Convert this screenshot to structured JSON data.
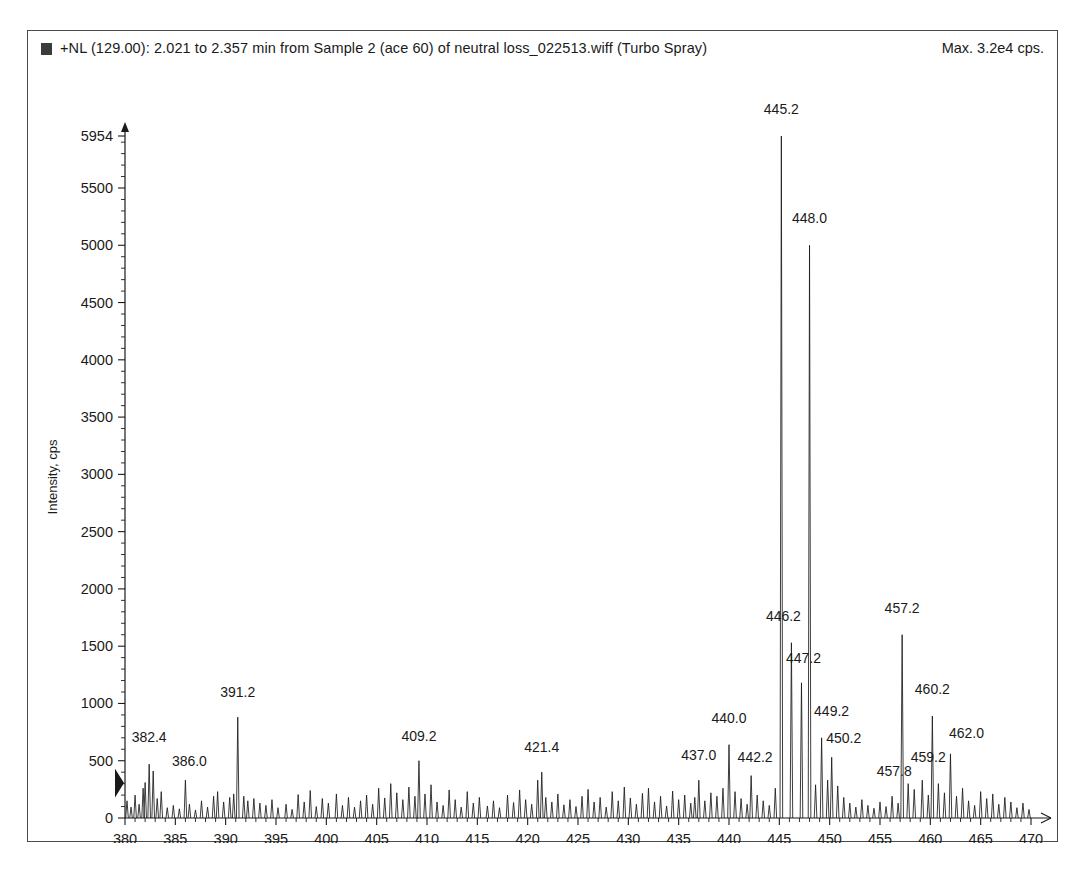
{
  "header": {
    "marker_icon": "filled-square-icon",
    "title": "+NL (129.00): 2.021 to 2.357 min from Sample 2 (ace 60) of neutral loss_022513.wiff (Turbo Spray)",
    "max_label": "Max. 3.2e4 cps."
  },
  "chart_data": {
    "type": "line",
    "title": "+NL (129.00): 2.021 to 2.357 min from Sample 2 (ace 60) of neutral loss_022513.wiff (Turbo Spray)",
    "subtitle": "Max. 3.2e4 cps.",
    "xlabel": "m/z, Da",
    "ylabel": "Intensity, cps",
    "xlim": [
      380,
      470
    ],
    "ylim": [
      0,
      5954
    ],
    "grid": false,
    "legend": "none",
    "xticks": [
      380,
      385,
      390,
      395,
      400,
      405,
      410,
      415,
      420,
      425,
      430,
      435,
      440,
      445,
      450,
      455,
      460,
      465,
      470
    ],
    "xtick_labels": [
      "380",
      "385",
      "390",
      "395",
      "400",
      "405",
      "410",
      "415",
      "420",
      "425",
      "430",
      "435",
      "440",
      "445",
      "450",
      "455",
      "460",
      "465",
      "470"
    ],
    "xtick_minor_step": 1,
    "yticks": [
      0,
      500,
      1000,
      1500,
      2000,
      2500,
      3000,
      3500,
      4000,
      4500,
      5000,
      5500,
      5954
    ],
    "ytick_labels": [
      "0",
      "500",
      "1000",
      "1500",
      "2000",
      "2500",
      "3000",
      "3500",
      "4000",
      "4500",
      "5000",
      "5500",
      "5954"
    ],
    "ytick_minor_step": 100,
    "y_max_value": 5954,
    "annotated_peaks": [
      {
        "mz": 382.4,
        "intensity": 470,
        "label": "382.4"
      },
      {
        "mz": 386.0,
        "intensity": 330,
        "label": "386.0"
      },
      {
        "mz": 391.2,
        "intensity": 880,
        "label": "391.2"
      },
      {
        "mz": 409.2,
        "intensity": 500,
        "label": "409.2"
      },
      {
        "mz": 421.4,
        "intensity": 400,
        "label": "421.4"
      },
      {
        "mz": 437.0,
        "intensity": 330,
        "label": "437.0"
      },
      {
        "mz": 440.0,
        "intensity": 640,
        "label": "440.0"
      },
      {
        "mz": 442.2,
        "intensity": 370,
        "label": "442.2"
      },
      {
        "mz": 445.2,
        "intensity": 5954,
        "label": "445.2"
      },
      {
        "mz": 446.2,
        "intensity": 1530,
        "label": "446.2"
      },
      {
        "mz": 447.2,
        "intensity": 1180,
        "label": "447.2"
      },
      {
        "mz": 448.0,
        "intensity": 5000,
        "label": "448.0"
      },
      {
        "mz": 449.2,
        "intensity": 700,
        "label": "449.2"
      },
      {
        "mz": 450.2,
        "intensity": 530,
        "label": "450.2"
      },
      {
        "mz": 457.2,
        "intensity": 1600,
        "label": "457.2"
      },
      {
        "mz": 457.8,
        "intensity": 300,
        "label": "457.8"
      },
      {
        "mz": 459.2,
        "intensity": 330,
        "label": "459.2"
      },
      {
        "mz": 460.2,
        "intensity": 890,
        "label": "460.2"
      },
      {
        "mz": 462.0,
        "intensity": 560,
        "label": "462.0"
      }
    ],
    "background_peaks": [
      {
        "mz": 380.2,
        "intensity": 150
      },
      {
        "mz": 380.6,
        "intensity": 95
      },
      {
        "mz": 381.0,
        "intensity": 200
      },
      {
        "mz": 381.4,
        "intensity": 120
      },
      {
        "mz": 381.8,
        "intensity": 260
      },
      {
        "mz": 382.0,
        "intensity": 310
      },
      {
        "mz": 382.8,
        "intensity": 410
      },
      {
        "mz": 383.2,
        "intensity": 170
      },
      {
        "mz": 383.6,
        "intensity": 230
      },
      {
        "mz": 384.2,
        "intensity": 90
      },
      {
        "mz": 384.8,
        "intensity": 110
      },
      {
        "mz": 385.4,
        "intensity": 80
      },
      {
        "mz": 386.4,
        "intensity": 120
      },
      {
        "mz": 387.0,
        "intensity": 70
      },
      {
        "mz": 387.6,
        "intensity": 150
      },
      {
        "mz": 388.2,
        "intensity": 95
      },
      {
        "mz": 388.8,
        "intensity": 190
      },
      {
        "mz": 389.2,
        "intensity": 230
      },
      {
        "mz": 389.8,
        "intensity": 140
      },
      {
        "mz": 390.4,
        "intensity": 180
      },
      {
        "mz": 390.8,
        "intensity": 210
      },
      {
        "mz": 391.8,
        "intensity": 190
      },
      {
        "mz": 392.2,
        "intensity": 150
      },
      {
        "mz": 392.8,
        "intensity": 170
      },
      {
        "mz": 393.4,
        "intensity": 130
      },
      {
        "mz": 394.0,
        "intensity": 110
      },
      {
        "mz": 394.6,
        "intensity": 160
      },
      {
        "mz": 395.2,
        "intensity": 90
      },
      {
        "mz": 396.0,
        "intensity": 120
      },
      {
        "mz": 396.6,
        "intensity": 75
      },
      {
        "mz": 397.2,
        "intensity": 205
      },
      {
        "mz": 397.8,
        "intensity": 140
      },
      {
        "mz": 398.4,
        "intensity": 240
      },
      {
        "mz": 399.0,
        "intensity": 100
      },
      {
        "mz": 399.6,
        "intensity": 170
      },
      {
        "mz": 400.2,
        "intensity": 130
      },
      {
        "mz": 401.0,
        "intensity": 210
      },
      {
        "mz": 401.6,
        "intensity": 110
      },
      {
        "mz": 402.2,
        "intensity": 180
      },
      {
        "mz": 402.8,
        "intensity": 95
      },
      {
        "mz": 403.4,
        "intensity": 150
      },
      {
        "mz": 404.0,
        "intensity": 200
      },
      {
        "mz": 404.6,
        "intensity": 120
      },
      {
        "mz": 405.2,
        "intensity": 260
      },
      {
        "mz": 405.8,
        "intensity": 175
      },
      {
        "mz": 406.4,
        "intensity": 300
      },
      {
        "mz": 407.0,
        "intensity": 220
      },
      {
        "mz": 407.6,
        "intensity": 160
      },
      {
        "mz": 408.2,
        "intensity": 270
      },
      {
        "mz": 408.8,
        "intensity": 190
      },
      {
        "mz": 409.8,
        "intensity": 210
      },
      {
        "mz": 410.4,
        "intensity": 290
      },
      {
        "mz": 411.0,
        "intensity": 140
      },
      {
        "mz": 411.6,
        "intensity": 110
      },
      {
        "mz": 412.2,
        "intensity": 245
      },
      {
        "mz": 412.8,
        "intensity": 160
      },
      {
        "mz": 413.4,
        "intensity": 95
      },
      {
        "mz": 414.0,
        "intensity": 230
      },
      {
        "mz": 414.6,
        "intensity": 130
      },
      {
        "mz": 415.2,
        "intensity": 180
      },
      {
        "mz": 416.0,
        "intensity": 105
      },
      {
        "mz": 416.6,
        "intensity": 150
      },
      {
        "mz": 417.2,
        "intensity": 90
      },
      {
        "mz": 418.0,
        "intensity": 200
      },
      {
        "mz": 418.6,
        "intensity": 135
      },
      {
        "mz": 419.2,
        "intensity": 245
      },
      {
        "mz": 419.8,
        "intensity": 160
      },
      {
        "mz": 420.4,
        "intensity": 120
      },
      {
        "mz": 421.0,
        "intensity": 330
      },
      {
        "mz": 421.8,
        "intensity": 180
      },
      {
        "mz": 422.4,
        "intensity": 140
      },
      {
        "mz": 423.0,
        "intensity": 210
      },
      {
        "mz": 423.6,
        "intensity": 115
      },
      {
        "mz": 424.2,
        "intensity": 160
      },
      {
        "mz": 424.8,
        "intensity": 100
      },
      {
        "mz": 425.4,
        "intensity": 190
      },
      {
        "mz": 426.0,
        "intensity": 250
      },
      {
        "mz": 426.6,
        "intensity": 140
      },
      {
        "mz": 427.2,
        "intensity": 180
      },
      {
        "mz": 427.8,
        "intensity": 95
      },
      {
        "mz": 428.4,
        "intensity": 230
      },
      {
        "mz": 429.0,
        "intensity": 150
      },
      {
        "mz": 429.6,
        "intensity": 270
      },
      {
        "mz": 430.2,
        "intensity": 175
      },
      {
        "mz": 430.8,
        "intensity": 120
      },
      {
        "mz": 431.4,
        "intensity": 215
      },
      {
        "mz": 432.0,
        "intensity": 260
      },
      {
        "mz": 432.6,
        "intensity": 140
      },
      {
        "mz": 433.2,
        "intensity": 190
      },
      {
        "mz": 433.8,
        "intensity": 105
      },
      {
        "mz": 434.4,
        "intensity": 235
      },
      {
        "mz": 435.0,
        "intensity": 160
      },
      {
        "mz": 435.6,
        "intensity": 200
      },
      {
        "mz": 436.2,
        "intensity": 130
      },
      {
        "mz": 436.6,
        "intensity": 180
      },
      {
        "mz": 437.6,
        "intensity": 150
      },
      {
        "mz": 438.2,
        "intensity": 220
      },
      {
        "mz": 438.8,
        "intensity": 190
      },
      {
        "mz": 439.4,
        "intensity": 260
      },
      {
        "mz": 440.6,
        "intensity": 230
      },
      {
        "mz": 441.2,
        "intensity": 170
      },
      {
        "mz": 441.8,
        "intensity": 120
      },
      {
        "mz": 442.8,
        "intensity": 200
      },
      {
        "mz": 443.4,
        "intensity": 150
      },
      {
        "mz": 444.0,
        "intensity": 110
      },
      {
        "mz": 444.6,
        "intensity": 260
      },
      {
        "mz": 448.6,
        "intensity": 290
      },
      {
        "mz": 449.8,
        "intensity": 330
      },
      {
        "mz": 450.8,
        "intensity": 280
      },
      {
        "mz": 451.4,
        "intensity": 180
      },
      {
        "mz": 452.0,
        "intensity": 130
      },
      {
        "mz": 452.6,
        "intensity": 95
      },
      {
        "mz": 453.2,
        "intensity": 160
      },
      {
        "mz": 453.8,
        "intensity": 110
      },
      {
        "mz": 454.4,
        "intensity": 85
      },
      {
        "mz": 455.0,
        "intensity": 140
      },
      {
        "mz": 455.6,
        "intensity": 100
      },
      {
        "mz": 456.2,
        "intensity": 190
      },
      {
        "mz": 456.8,
        "intensity": 130
      },
      {
        "mz": 458.4,
        "intensity": 250
      },
      {
        "mz": 459.8,
        "intensity": 200
      },
      {
        "mz": 460.8,
        "intensity": 300
      },
      {
        "mz": 461.4,
        "intensity": 220
      },
      {
        "mz": 462.6,
        "intensity": 190
      },
      {
        "mz": 463.2,
        "intensity": 260
      },
      {
        "mz": 463.8,
        "intensity": 150
      },
      {
        "mz": 464.4,
        "intensity": 110
      },
      {
        "mz": 465.0,
        "intensity": 230
      },
      {
        "mz": 465.6,
        "intensity": 170
      },
      {
        "mz": 466.2,
        "intensity": 210
      },
      {
        "mz": 466.8,
        "intensity": 120
      },
      {
        "mz": 467.4,
        "intensity": 180
      },
      {
        "mz": 468.0,
        "intensity": 140
      },
      {
        "mz": 468.6,
        "intensity": 90
      },
      {
        "mz": 469.2,
        "intensity": 130
      },
      {
        "mz": 469.8,
        "intensity": 75
      }
    ]
  }
}
